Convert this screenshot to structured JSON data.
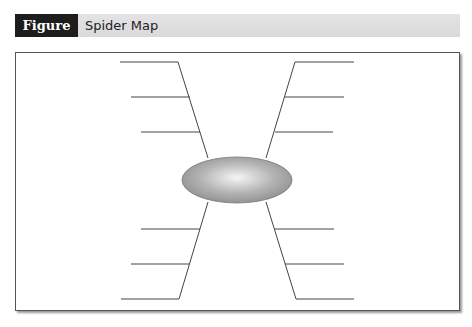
{
  "figure": {
    "number": "Figure 6.9",
    "title": "Spider Map"
  },
  "diagram": {
    "type": "spider-map",
    "center": {
      "shape": "ellipse",
      "cx": 237,
      "cy": 180,
      "rx": 55,
      "ry": 23,
      "label": ""
    },
    "legs": [
      {
        "name": "upper-left",
        "diag": [
          178,
          62,
          208,
          158
        ],
        "branches": [
          [
            120,
            178,
            62
          ],
          [
            131,
            190,
            97
          ],
          [
            141,
            200,
            132
          ]
        ]
      },
      {
        "name": "upper-right",
        "diag": [
          295,
          62,
          266,
          158
        ],
        "branches": [
          [
            295,
            354,
            62
          ],
          [
            285,
            344,
            97
          ],
          [
            275,
            333,
            132
          ]
        ]
      },
      {
        "name": "lower-left",
        "diag": [
          208,
          202,
          179,
          299
        ],
        "branches": [
          [
            141,
            200,
            229
          ],
          [
            131,
            189,
            264
          ],
          [
            121,
            179,
            299
          ]
        ]
      },
      {
        "name": "lower-right",
        "diag": [
          266,
          202,
          296,
          299
        ],
        "branches": [
          [
            275,
            334,
            229
          ],
          [
            285,
            344,
            264
          ],
          [
            296,
            354,
            299
          ]
        ]
      }
    ],
    "colors": {
      "line": "#444444",
      "ellipse_center": "#f4f4f4",
      "ellipse_edge": "#8a8a8a"
    }
  }
}
